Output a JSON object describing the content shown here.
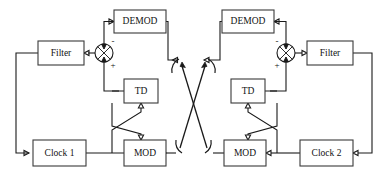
{
  "figure": {
    "type": "block-diagram",
    "canvas": {
      "width": 387,
      "height": 181
    },
    "background_color": "#ffffff",
    "line_color": "#1a1a1a",
    "block_fill": "#ffffff",
    "block_stroke": "#3a3a3a"
  },
  "blocks": {
    "left": {
      "filter": {
        "label": "Filter",
        "x": 38,
        "y": 41,
        "w": 46,
        "h": 24
      },
      "demod": {
        "label": "DEMOD",
        "x": 114,
        "y": 10,
        "w": 52,
        "h": 23
      },
      "td": {
        "label": "TD",
        "x": 124,
        "y": 79,
        "w": 34,
        "h": 24
      },
      "clock": {
        "label": "Clock 1",
        "x": 33,
        "y": 140,
        "w": 53,
        "h": 26
      },
      "mod": {
        "label": "MOD",
        "x": 124,
        "y": 140,
        "w": 42,
        "h": 26
      }
    },
    "right": {
      "filter": {
        "label": "Filter",
        "x": 307,
        "y": 41,
        "w": 46,
        "h": 24
      },
      "demod": {
        "label": "DEMOD",
        "x": 222,
        "y": 10,
        "w": 52,
        "h": 23
      },
      "td": {
        "label": "TD",
        "x": 231,
        "y": 79,
        "w": 34,
        "h": 24
      },
      "clock": {
        "label": "Clock 2",
        "x": 300,
        "y": 140,
        "w": 53,
        "h": 26
      },
      "mod": {
        "label": "MOD",
        "x": 224,
        "y": 140,
        "w": 42,
        "h": 26
      }
    }
  },
  "summing_junctions": {
    "left": {
      "cx": 104,
      "cy": 53,
      "r": 9,
      "plus_label": "+",
      "minus_label": "-"
    },
    "right": {
      "cx": 286,
      "cy": 53,
      "r": 9,
      "plus_label": "+",
      "minus_label": "-"
    }
  },
  "channel": {
    "description": "Cross-coupled wireless link between the two MOD transmitters and the two DEMOD receivers",
    "arcs": 4
  }
}
